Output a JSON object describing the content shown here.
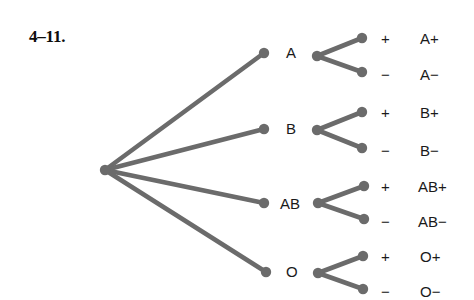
{
  "figure": {
    "exercise_number": "4–11.",
    "colors": {
      "branch": "#6b6b6b",
      "node": "#6b6b6b",
      "text": "#1a1a1a",
      "background": "#ffffff"
    }
  },
  "chart_data": {
    "type": "tree",
    "title": "",
    "root": {
      "label": "",
      "x": 105,
      "y": 170
    },
    "levels": [
      {
        "name": "blood-type",
        "labels": [
          "A",
          "B",
          "AB",
          "O"
        ]
      },
      {
        "name": "rh-factor",
        "labels": [
          "+",
          "−"
        ]
      },
      {
        "name": "outcome",
        "labels": [
          "A+",
          "A−",
          "B+",
          "B−",
          "AB+",
          "AB−",
          "O+",
          "O−"
        ]
      }
    ],
    "branches": [
      {
        "type_label": "A",
        "type_node": {
          "x": 264,
          "y": 53
        },
        "type_label_pos": {
          "x": 286,
          "y": 45
        },
        "junction": {
          "x": 317,
          "y": 56
        },
        "children": [
          {
            "sign": "+",
            "outcome": "A+",
            "node": {
              "x": 362,
              "y": 38
            },
            "sign_pos": {
              "x": 381,
              "y": 31
            },
            "outcome_pos": {
              "x": 420,
              "y": 31
            }
          },
          {
            "sign": "−",
            "outcome": "A−",
            "node": {
              "x": 362,
              "y": 72
            },
            "sign_pos": {
              "x": 381,
              "y": 67
            },
            "outcome_pos": {
              "x": 420,
              "y": 67
            }
          }
        ]
      },
      {
        "type_label": "B",
        "type_node": {
          "x": 264,
          "y": 129
        },
        "type_label_pos": {
          "x": 286,
          "y": 121
        },
        "junction": {
          "x": 317,
          "y": 130
        },
        "children": [
          {
            "sign": "+",
            "outcome": "B+",
            "node": {
              "x": 362,
              "y": 112
            },
            "sign_pos": {
              "x": 381,
              "y": 105
            },
            "outcome_pos": {
              "x": 420,
              "y": 105
            }
          },
          {
            "sign": "−",
            "outcome": "B−",
            "node": {
              "x": 362,
              "y": 148
            },
            "sign_pos": {
              "x": 381,
              "y": 143
            },
            "outcome_pos": {
              "x": 420,
              "y": 143
            }
          }
        ]
      },
      {
        "type_label": "AB",
        "type_node": {
          "x": 264,
          "y": 203
        },
        "type_label_pos": {
          "x": 280,
          "y": 196
        },
        "junction": {
          "x": 318,
          "y": 203
        },
        "children": [
          {
            "sign": "+",
            "outcome": "AB+",
            "node": {
              "x": 364,
              "y": 186
            },
            "sign_pos": {
              "x": 381,
              "y": 179
            },
            "outcome_pos": {
              "x": 418,
              "y": 179
            }
          },
          {
            "sign": "−",
            "outcome": "AB−",
            "node": {
              "x": 364,
              "y": 219
            },
            "sign_pos": {
              "x": 381,
              "y": 214
            },
            "outcome_pos": {
              "x": 418,
              "y": 214
            }
          }
        ]
      },
      {
        "type_label": "O",
        "type_node": {
          "x": 266,
          "y": 272
        },
        "type_label_pos": {
          "x": 286,
          "y": 264
        },
        "junction": {
          "x": 318,
          "y": 273
        },
        "children": [
          {
            "sign": "+",
            "outcome": "O+",
            "node": {
              "x": 363,
              "y": 256
            },
            "sign_pos": {
              "x": 381,
              "y": 249
            },
            "outcome_pos": {
              "x": 420,
              "y": 249
            }
          },
          {
            "sign": "−",
            "outcome": "O−",
            "node": {
              "x": 363,
              "y": 289
            },
            "sign_pos": {
              "x": 381,
              "y": 284
            },
            "outcome_pos": {
              "x": 420,
              "y": 284
            }
          }
        ]
      }
    ]
  }
}
